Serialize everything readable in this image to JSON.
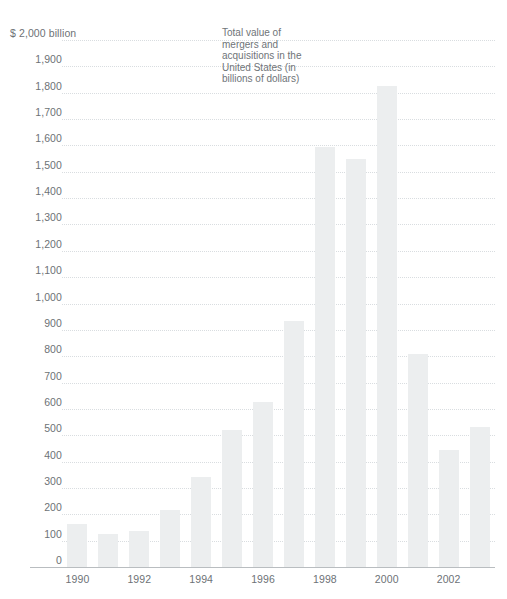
{
  "chart_data": {
    "type": "bar",
    "title": "",
    "annotation": "Total value of mergers and acquisitions in the United States (in billions of dollars)",
    "annotation_lines": [
      "Total value of",
      "mergers and",
      "acquisitions in the",
      "United States (in",
      "billions of dollars)"
    ],
    "xlabel": "",
    "ylabel": "$ 2,000 billion",
    "ylim": [
      0,
      2000
    ],
    "grid": true,
    "legend": "none",
    "bar_color": "#eceeef",
    "axis_color": "#b9bdc0",
    "grid_color": "#d9dde0",
    "text_color": "#6d7276",
    "y_ticks": [
      {
        "value": 2000,
        "label": "$ 2,000 billion"
      },
      {
        "value": 1900,
        "label": "1,900"
      },
      {
        "value": 1800,
        "label": "1,800"
      },
      {
        "value": 1700,
        "label": "1,700"
      },
      {
        "value": 1600,
        "label": "1,600"
      },
      {
        "value": 1500,
        "label": "1,500"
      },
      {
        "value": 1400,
        "label": "1,400"
      },
      {
        "value": 1300,
        "label": "1,300"
      },
      {
        "value": 1200,
        "label": "1,200"
      },
      {
        "value": 1100,
        "label": "1,100"
      },
      {
        "value": 1000,
        "label": "1,000"
      },
      {
        "value": 900,
        "label": "900"
      },
      {
        "value": 800,
        "label": "800"
      },
      {
        "value": 700,
        "label": "700"
      },
      {
        "value": 600,
        "label": "600"
      },
      {
        "value": 500,
        "label": "500"
      },
      {
        "value": 400,
        "label": "400"
      },
      {
        "value": 300,
        "label": "300"
      },
      {
        "value": 200,
        "label": "200"
      },
      {
        "value": 100,
        "label": "100"
      },
      {
        "value": 0,
        "label": "0"
      }
    ],
    "categories": [
      "1990",
      "1991",
      "1992",
      "1993",
      "1994",
      "1995",
      "1996",
      "1997",
      "1998",
      "1999",
      "2000",
      "2001",
      "2002",
      "2003"
    ],
    "x_tick_labels": [
      "1990",
      "1992",
      "1994",
      "1996",
      "1998",
      "2000",
      "2002"
    ],
    "values": [
      165,
      125,
      135,
      215,
      340,
      520,
      625,
      935,
      1595,
      1550,
      1825,
      810,
      445,
      530
    ]
  }
}
